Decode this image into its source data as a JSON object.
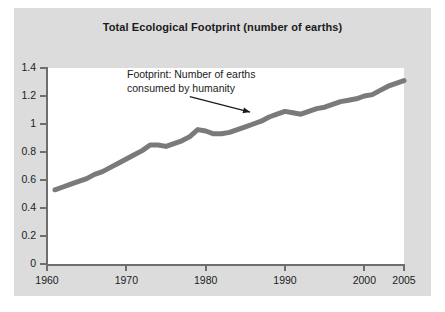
{
  "figure": {
    "background_color": "#dcdcdc",
    "plot_background_color": "#ffffff",
    "axis_color": "#6e6e6e",
    "line_color": "#7a7a7a",
    "text_color": "#1b1b1b"
  },
  "chart_data": {
    "type": "line",
    "title": "Total Ecological Footprint (number of earths)",
    "xlabel": "",
    "ylabel": "",
    "xlim": [
      1960,
      2005
    ],
    "ylim": [
      0,
      1.4
    ],
    "grid": false,
    "legend": null,
    "xticks": [
      1960,
      1970,
      1980,
      1990,
      2000,
      2005
    ],
    "xtick_labels": [
      "1960",
      "1970",
      "1980",
      "1990",
      "2000",
      "2005"
    ],
    "yticks": [
      0,
      0.2,
      0.4,
      0.6,
      0.8,
      1.0,
      1.2,
      1.4
    ],
    "ytick_labels": [
      "0",
      "0.2",
      "0.4",
      "0.6",
      "0.8",
      "1",
      "1.2",
      "1.4"
    ],
    "annotations": [
      {
        "text": "Footprint: Number of earths\nconsumed by humanity",
        "arrow_from": [
          1978.0,
          1.195
        ],
        "arrow_to": [
          1985.6,
          1.085
        ]
      }
    ],
    "series": [
      {
        "name": "Footprint: Number of earths consumed by humanity",
        "color": "#7a7a7a",
        "linewidth": 5,
        "x": [
          1961,
          1962,
          1963,
          1964,
          1965,
          1966,
          1967,
          1968,
          1969,
          1970,
          1971,
          1972,
          1973,
          1974,
          1975,
          1976,
          1977,
          1978,
          1979,
          1980,
          1981,
          1982,
          1983,
          1984,
          1985,
          1986,
          1987,
          1988,
          1989,
          1990,
          1991,
          1992,
          1993,
          1994,
          1995,
          1996,
          1997,
          1998,
          1999,
          2000,
          2001,
          2002,
          2003,
          2004,
          2005
        ],
        "y": [
          0.53,
          0.55,
          0.57,
          0.59,
          0.61,
          0.64,
          0.66,
          0.69,
          0.72,
          0.75,
          0.78,
          0.81,
          0.85,
          0.85,
          0.84,
          0.86,
          0.88,
          0.91,
          0.96,
          0.95,
          0.93,
          0.93,
          0.94,
          0.96,
          0.98,
          1.0,
          1.02,
          1.05,
          1.07,
          1.09,
          1.08,
          1.07,
          1.09,
          1.11,
          1.12,
          1.14,
          1.16,
          1.17,
          1.18,
          1.2,
          1.21,
          1.24,
          1.27,
          1.29,
          1.31
        ]
      }
    ]
  }
}
